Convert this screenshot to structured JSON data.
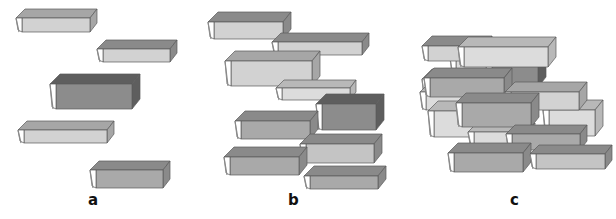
{
  "figure": {
    "colors": {
      "outline": "#5a5a5a",
      "page_end": "#ffffff",
      "spine": "#8a8a8a",
      "shades": {
        "light": {
          "front": "#d2d2d2",
          "top": "#a6a6a6"
        },
        "medium": {
          "front": "#a9a9a9",
          "top": "#8a8a8a"
        },
        "dark": {
          "front": "#8c8c8c",
          "top": "#5e5e5e"
        },
        "pale": {
          "front": "#dcdcdc",
          "top": "#b8b8b8"
        }
      }
    },
    "panels": [
      {
        "id": "a",
        "label": "a",
        "label_pos": [
          88,
          193
        ],
        "books": [
          {
            "x": 16,
            "y": 18,
            "w": 74,
            "h": 14,
            "d": 9,
            "shade": "light"
          },
          {
            "x": 97,
            "y": 49,
            "w": 73,
            "h": 13,
            "d": 9,
            "shade": "medium_top_light_front"
          },
          {
            "x": 50,
            "y": 84,
            "w": 82,
            "h": 25,
            "d": 10,
            "shade": "dark"
          },
          {
            "x": 18,
            "y": 130,
            "w": 89,
            "h": 13,
            "d": 9,
            "shade": "light"
          },
          {
            "x": 90,
            "y": 170,
            "w": 73,
            "h": 18,
            "d": 9,
            "shade": "medium"
          }
        ]
      },
      {
        "id": "b",
        "label": "b",
        "label_pos": [
          288,
          193
        ],
        "books": [
          {
            "x": 208,
            "y": 22,
            "w": 75,
            "h": 17,
            "d": 10,
            "shade": "medium_top_light_front"
          },
          {
            "x": 272,
            "y": 42,
            "w": 90,
            "h": 13,
            "d": 9,
            "shade": "medium_top_light_front"
          },
          {
            "x": 225,
            "y": 61,
            "w": 87,
            "h": 25,
            "d": 10,
            "shade": "light"
          },
          {
            "x": 276,
            "y": 88,
            "w": 74,
            "h": 12,
            "d": 8,
            "shade": "pale"
          },
          {
            "x": 316,
            "y": 104,
            "w": 60,
            "h": 26,
            "d": 10,
            "shade": "dark"
          },
          {
            "x": 235,
            "y": 121,
            "w": 75,
            "h": 18,
            "d": 10,
            "shade": "medium"
          },
          {
            "x": 300,
            "y": 144,
            "w": 74,
            "h": 19,
            "d": 10,
            "shade": "light_front_medium_top"
          },
          {
            "x": 224,
            "y": 157,
            "w": 75,
            "h": 18,
            "d": 10,
            "shade": "medium"
          },
          {
            "x": 304,
            "y": 176,
            "w": 74,
            "h": 13,
            "d": 10,
            "shade": "medium"
          }
        ]
      },
      {
        "id": "c",
        "label": "c",
        "label_pos": [
          510,
          193
        ],
        "books": [
          {
            "x": 422,
            "y": 79,
            "w": 63,
            "h": 22,
            "d": 10,
            "shade": "pale"
          },
          {
            "x": 420,
            "y": 92,
            "w": 58,
            "h": 18,
            "d": 10,
            "shade": "pale"
          },
          {
            "x": 428,
            "y": 111,
            "w": 50,
            "h": 26,
            "d": 10,
            "shade": "pale"
          },
          {
            "x": 450,
            "y": 58,
            "w": 53,
            "h": 18,
            "d": 10,
            "shade": "pale"
          },
          {
            "x": 422,
            "y": 46,
            "w": 62,
            "h": 15,
            "d": 10,
            "shade": "medium_top_light_front"
          },
          {
            "x": 486,
            "y": 65,
            "w": 52,
            "h": 22,
            "d": 10,
            "shade": "dark"
          },
          {
            "x": 424,
            "y": 78,
            "w": 80,
            "h": 19,
            "d": 10,
            "shade": "medium"
          },
          {
            "x": 458,
            "y": 47,
            "w": 90,
            "h": 20,
            "d": 10,
            "shade": "pale"
          },
          {
            "x": 543,
            "y": 110,
            "w": 52,
            "h": 26,
            "d": 10,
            "shade": "pale"
          },
          {
            "x": 505,
            "y": 92,
            "w": 74,
            "h": 18,
            "d": 10,
            "shade": "light"
          },
          {
            "x": 468,
            "y": 132,
            "w": 60,
            "h": 14,
            "d": 9,
            "shade": "pale"
          },
          {
            "x": 456,
            "y": 103,
            "w": 75,
            "h": 24,
            "d": 10,
            "shade": "medium"
          },
          {
            "x": 506,
            "y": 134,
            "w": 74,
            "h": 16,
            "d": 9,
            "shade": "medium"
          },
          {
            "x": 448,
            "y": 153,
            "w": 75,
            "h": 19,
            "d": 10,
            "shade": "medium"
          },
          {
            "x": 530,
            "y": 154,
            "w": 75,
            "h": 15,
            "d": 9,
            "shade": "light_front_medium_top"
          }
        ]
      }
    ]
  }
}
